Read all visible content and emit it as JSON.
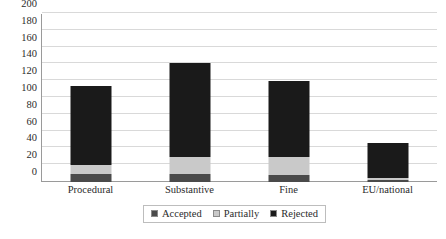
{
  "chart_data": {
    "type": "bar",
    "subtype": "stacked-column",
    "title": "",
    "xlabel": "",
    "ylabel": "",
    "ylim": [
      0,
      200
    ],
    "ytick_step": 20,
    "yticks": [
      200,
      180,
      160,
      140,
      120,
      100,
      80,
      60,
      40,
      20,
      0
    ],
    "ytick_labels": [
      "200",
      "180",
      "160",
      "140",
      "120",
      "100",
      "80",
      "60",
      "40",
      "20",
      "0"
    ],
    "grid": true,
    "grid_axis": "y",
    "legend_position": "bottom",
    "categories": [
      "Procedural",
      "Substantive",
      "Fine",
      "EU/national"
    ],
    "series": [
      {
        "name": "Accepted",
        "color": "#4a4a4a",
        "values": [
          10,
          10,
          8,
          2
        ]
      },
      {
        "name": "Partially",
        "color": "#c9c9c9",
        "values": [
          10,
          20,
          22,
          3
        ]
      },
      {
        "name": "Rejected",
        "color": "#1a1a1a",
        "values": [
          94,
          112,
          90,
          41
        ]
      }
    ],
    "totals": [
      114,
      142,
      120,
      46
    ]
  },
  "legend": {
    "items": [
      {
        "label": "Accepted",
        "color": "#4a4a4a"
      },
      {
        "label": "Partially",
        "color": "#c9c9c9"
      },
      {
        "label": "Rejected",
        "color": "#1a1a1a"
      }
    ]
  }
}
